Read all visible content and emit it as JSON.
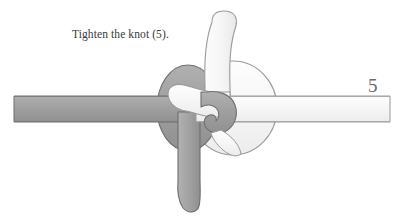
{
  "figure": {
    "caption": "Tighten the knot (5).",
    "step_number": "5",
    "background_color": "#ffffff",
    "caption_color": "#3a3a3a",
    "step_number_color": "#6a6a6a"
  },
  "ropes": {
    "dark": {
      "name": "dark-gray-rope",
      "fill_color": "#9d9d9d",
      "outline_color": "#6f6f6f",
      "description": "Medium gray rope entering horizontally from the left edge, forming an oval loop at the knot center and exiting downward as a vertical tail."
    },
    "light": {
      "name": "light-white-rope",
      "fill_color": "#f7f7f7",
      "outline_color": "#9a9a9a",
      "description": "Near-white rope rising vertically above the knot, looping through the center and exiting horizontally to the right edge."
    }
  },
  "elements": {
    "dark_horizontal_left": "dark-rope-left-segment",
    "dark_loop": "dark-rope-oval-loop",
    "dark_vertical_tail": "dark-rope-bottom-tail",
    "dark_hook": "dark-rope-hook-bight",
    "light_vertical_top": "light-rope-top-tail",
    "light_loop": "light-rope-round-loop",
    "light_horizontal_right": "light-rope-right-segment"
  }
}
